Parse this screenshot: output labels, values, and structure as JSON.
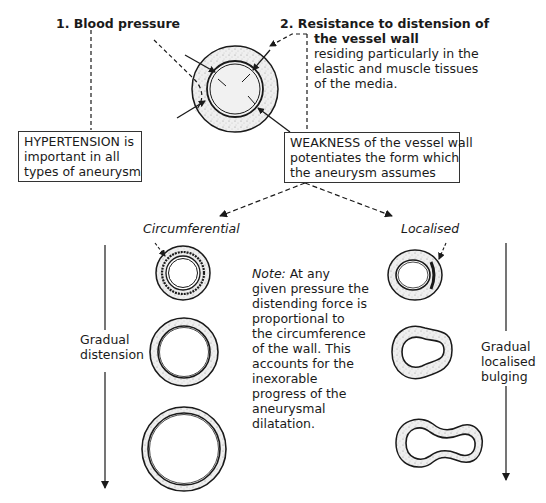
{
  "figure": {
    "top_left_label": "1. Blood pressure",
    "top_right_label": {
      "bold_lines": [
        "2. Resistance to distension of",
        "the vessel wall"
      ],
      "lines": [
        "residing particularly in the",
        "elastic and muscle tissues",
        "of the media."
      ]
    },
    "hypertension_box": {
      "lines": [
        "HYPERTENSION is",
        "important in all",
        "types of aneurysm"
      ]
    },
    "weakness_box": {
      "lines": [
        "WEAKNESS of the vessel wall",
        "potentiates the form which",
        "the aneurysm assumes"
      ]
    },
    "branch_left_label": "Circumferential",
    "branch_right_label": "Localised",
    "note": {
      "prefix": "Note:",
      "lines_first": " At any",
      "lines": [
        "given pressure the",
        "distending force is",
        "proportional to",
        "the circumference",
        "of the wall. This",
        "accounts for the",
        "inexorable",
        "progress of the",
        "aneurysmal",
        "dilatation."
      ]
    },
    "left_arrow_label": [
      "Gradual",
      "distension"
    ],
    "right_arrow_label": [
      "Gradual",
      "localised",
      "bulging"
    ],
    "colors": {
      "ink": "#1a1a1a",
      "wall_fill": "#e6e6e6",
      "background": "#ffffff"
    }
  }
}
